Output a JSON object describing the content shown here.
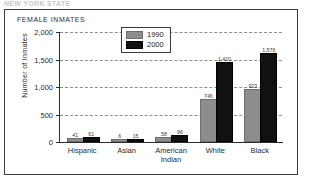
{
  "page": {
    "clipped_header_text": "NEW YORK STATE"
  },
  "chart_data": {
    "type": "bar",
    "title": "FEMALE INMATES",
    "xlabel": "",
    "ylabel": "Number of Inmates",
    "categories": [
      "Hispanic",
      "Asian",
      "American Indian",
      "White",
      "Black"
    ],
    "category_lines": [
      [
        "Hispanic"
      ],
      [
        "Asian"
      ],
      [
        "American",
        "Indian"
      ],
      [
        "White"
      ],
      [
        "Black"
      ]
    ],
    "series": [
      {
        "name": "1990",
        "color": "#8d8d8d",
        "values": [
          41,
          6,
          58,
          746,
          923
        ],
        "labels": [
          "41",
          "6",
          "58",
          "746",
          "923"
        ]
      },
      {
        "name": "2000",
        "color": "#111111",
        "values": [
          61,
          15,
          96,
          1420,
          1576
        ],
        "labels": [
          "61",
          "15",
          "96",
          "1,420",
          "1,576"
        ]
      }
    ],
    "ylim": [
      0,
      2000
    ],
    "yticks": [
      0,
      500,
      1000,
      1500,
      2000
    ],
    "ytick_labels": [
      "0",
      "500",
      "1,000",
      "1,500",
      "2,000"
    ],
    "grid": true,
    "grid_style": "dashed",
    "legend_position": "top-center",
    "legend": [
      {
        "label": "1990",
        "color": "#8d8d8d"
      },
      {
        "label": "2000",
        "color": "#111111"
      }
    ]
  }
}
